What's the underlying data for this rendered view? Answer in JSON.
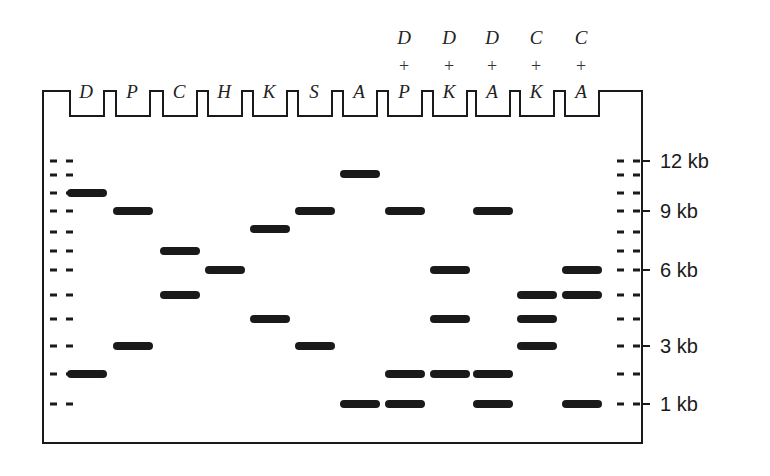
{
  "figure": {
    "type": "agarose gel restriction digest diagram",
    "colors": {
      "band": "#1a1a1a",
      "outline": "#1a1a1a",
      "background": "#ffffff"
    }
  },
  "gel": {
    "left": 43,
    "right": 642,
    "top": 91,
    "well_bottom": 116,
    "bottom": 443
  },
  "lanes": [
    {
      "id": "D",
      "top": "",
      "plus": "",
      "bottom": "D",
      "x": 87,
      "bands_y": [
        193,
        374
      ]
    },
    {
      "id": "P",
      "top": "",
      "plus": "",
      "bottom": "P",
      "x": 133,
      "bands_y": [
        211,
        346
      ]
    },
    {
      "id": "C",
      "top": "",
      "plus": "",
      "bottom": "C",
      "x": 180,
      "bands_y": [
        251,
        295
      ]
    },
    {
      "id": "H",
      "top": "",
      "plus": "",
      "bottom": "H",
      "x": 225,
      "bands_y": [
        270
      ]
    },
    {
      "id": "K",
      "top": "",
      "plus": "",
      "bottom": "K",
      "x": 270,
      "bands_y": [
        229,
        319
      ]
    },
    {
      "id": "S",
      "top": "",
      "plus": "",
      "bottom": "S",
      "x": 315,
      "bands_y": [
        211,
        346
      ]
    },
    {
      "id": "A",
      "top": "",
      "plus": "",
      "bottom": "A",
      "x": 360,
      "bands_y": [
        174,
        404
      ]
    },
    {
      "id": "D+P",
      "top": "D",
      "plus": "+",
      "bottom": "P",
      "x": 405,
      "bands_y": [
        211,
        374,
        404
      ]
    },
    {
      "id": "D+K",
      "top": "D",
      "plus": "+",
      "bottom": "K",
      "x": 450,
      "bands_y": [
        270,
        319,
        374
      ]
    },
    {
      "id": "D+A",
      "top": "D",
      "plus": "+",
      "bottom": "A",
      "x": 493,
      "bands_y": [
        211,
        374,
        404
      ]
    },
    {
      "id": "C+K",
      "top": "C",
      "plus": "+",
      "bottom": "K",
      "x": 537,
      "bands_y": [
        295,
        319,
        346
      ]
    },
    {
      "id": "C+A",
      "top": "C",
      "plus": "+",
      "bottom": "A",
      "x": 582,
      "bands_y": [
        270,
        295,
        404
      ]
    }
  ],
  "ladder": {
    "ticks_y": [
      161,
      175,
      193,
      211,
      232,
      251,
      270,
      295,
      319,
      346,
      374,
      404
    ],
    "labels": [
      {
        "text": "12 kb",
        "y": 161
      },
      {
        "text": "9 kb",
        "y": 211
      },
      {
        "text": "6 kb",
        "y": 270
      },
      {
        "text": "3 kb",
        "y": 346
      },
      {
        "text": "1 kb",
        "y": 404
      }
    ]
  }
}
